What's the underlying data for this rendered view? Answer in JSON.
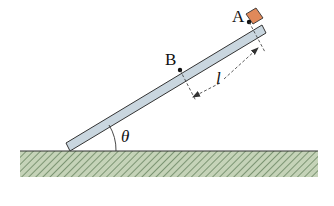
{
  "diagram": {
    "type": "inclined-plank-on-ground",
    "labels": {
      "point_a": "A",
      "point_b": "B",
      "length": "l",
      "angle": "θ"
    },
    "colors": {
      "plank_fill": "#c9d6df",
      "plank_stroke": "#333333",
      "block_fill": "#e0895a",
      "ground_fill": "#c5d3b8",
      "ground_hatch": "#5d7a55",
      "ground_line": "#333333",
      "dimension_line": "#333333"
    },
    "elements": [
      {
        "name": "plank",
        "description": "Long plank leaning at angle θ against the ground"
      },
      {
        "name": "block",
        "description": "Small orange block resting on plank at point A"
      },
      {
        "name": "point-a",
        "description": "Point A, upper position on plank"
      },
      {
        "name": "point-b",
        "description": "Point B, lower position on plank"
      },
      {
        "name": "dimension-l",
        "description": "Distance l between A and B, marked with dashed extension lines and arrows"
      },
      {
        "name": "angle-theta",
        "description": "Angle θ between plank and ground"
      },
      {
        "name": "ground",
        "description": "Hatched horizontal ground surface"
      }
    ]
  }
}
